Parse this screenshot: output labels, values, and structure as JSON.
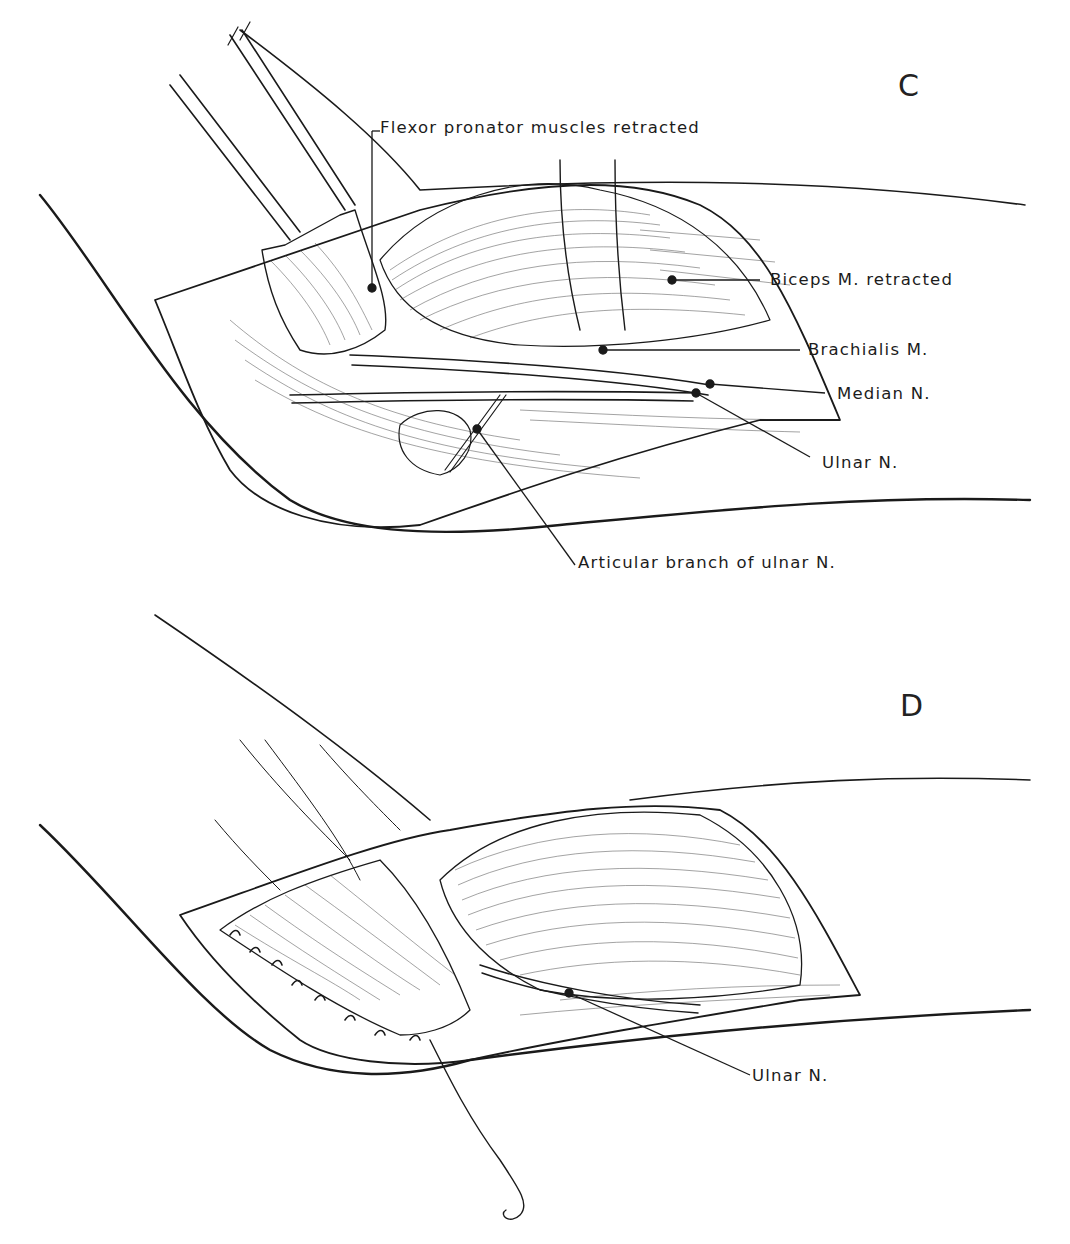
{
  "figure": {
    "panels": [
      {
        "id": "C",
        "letter": "C",
        "labels": {
          "flexor": "Flexor  pronator  muscles  retracted",
          "biceps": "Biceps  M.  retracted",
          "brachialis": "Brachialis  M.",
          "median": "Median  N.",
          "ulnar": "Ulnar  N.",
          "articular": "Articular  branch  of  ulnar  N."
        }
      },
      {
        "id": "D",
        "letter": "D",
        "labels": {
          "ulnar": "Ulnar  N."
        }
      }
    ],
    "colors": {
      "ink": "#1a1a1a",
      "paper": "#ffffff"
    }
  }
}
